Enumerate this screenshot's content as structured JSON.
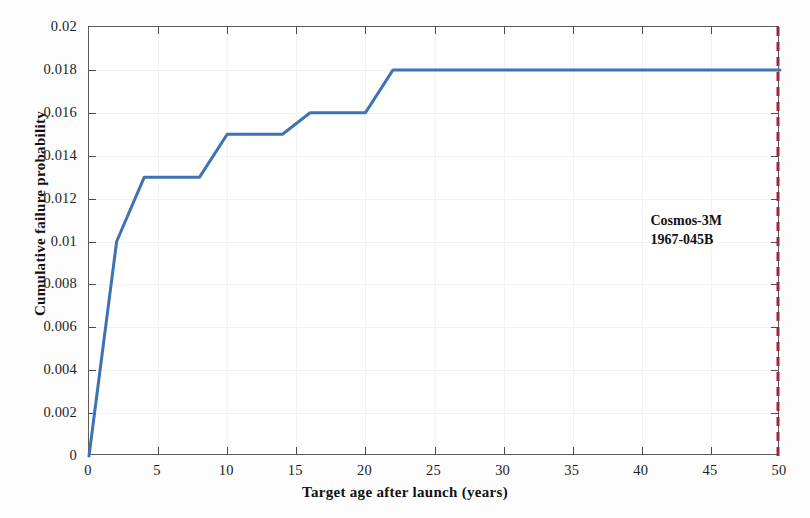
{
  "chart_data": {
    "type": "line",
    "title": "",
    "xlabel": "Target age after launch (years)",
    "ylabel": "Cumulative failure probability",
    "xlim": [
      0,
      50
    ],
    "ylim": [
      0,
      0.02
    ],
    "grid": true,
    "legend": null,
    "xticks": [
      0,
      5,
      10,
      15,
      20,
      25,
      30,
      35,
      40,
      45,
      50
    ],
    "xticklabels": [
      "0",
      "5",
      "10",
      "15",
      "20",
      "25",
      "30",
      "35",
      "40",
      "45",
      "50"
    ],
    "yticks": [
      0,
      0.002,
      0.004,
      0.006,
      0.008,
      0.01,
      0.012,
      0.014,
      0.016,
      0.018,
      0.02
    ],
    "yticklabels": [
      "0",
      "0.002",
      "0.004",
      "0.006",
      "0.008",
      "0.01",
      "0.012",
      "0.014",
      "0.016",
      "0.018",
      "0.02"
    ],
    "series": [
      {
        "name": "Cumulative failure probability",
        "color": "#3d72b4",
        "linewidth": 3,
        "style": "solid",
        "x": [
          0,
          2,
          4,
          8,
          10,
          14,
          16,
          20,
          22,
          50
        ],
        "y": [
          0,
          0.01,
          0.013,
          0.013,
          0.015,
          0.015,
          0.016,
          0.016,
          0.018,
          0.018
        ]
      }
    ],
    "vlines": [
      {
        "name": "cosmos-3m-marker",
        "x": 50,
        "color": "#a02638",
        "style": "dashed",
        "linewidth": 3
      }
    ],
    "annotations": [
      {
        "name": "cosmos-3m-annotation",
        "line1": "Cosmos-3M",
        "line2": "1967-045B",
        "x": 47.5,
        "y": 0.0105
      }
    ]
  },
  "colors": {
    "series_blue": "#3d72b4",
    "marker_red": "#a02638",
    "axis": "#5a5a5a",
    "text": "#111111",
    "grid": "#f2f2f2",
    "background": "#ffffff"
  }
}
